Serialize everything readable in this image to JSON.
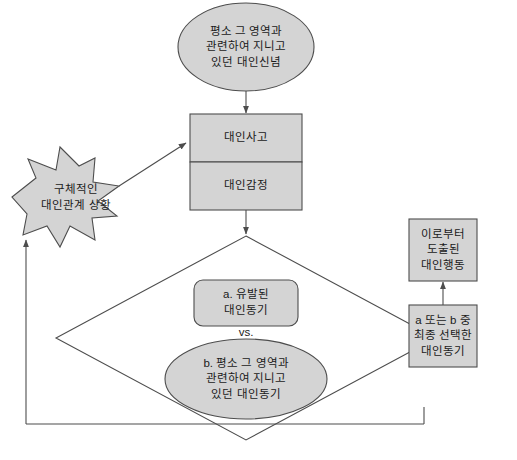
{
  "diagram": {
    "colors": {
      "fill": "#d4d4d4",
      "stroke": "#4d4d4d",
      "text": "#1a1a1a",
      "background": "#ffffff"
    },
    "nodes": [
      {
        "id": "prior-belief",
        "shape": "ellipse",
        "lines": [
          "평소 그 영역과",
          "관련하여 지니고",
          "있던 대인신념"
        ]
      },
      {
        "id": "interpersonal-thought",
        "shape": "rect",
        "lines": [
          "대인사고"
        ]
      },
      {
        "id": "interpersonal-emotion",
        "shape": "rect",
        "lines": [
          "대인감정"
        ]
      },
      {
        "id": "concrete-situation",
        "shape": "starburst",
        "lines": [
          "구체적인",
          "대인관계 상황"
        ]
      },
      {
        "id": "motive-a",
        "shape": "rounded-rect",
        "lines": [
          "a. 유발된",
          "대인동기"
        ]
      },
      {
        "id": "versus",
        "shape": "text",
        "lines": [
          "vs."
        ]
      },
      {
        "id": "motive-b",
        "shape": "ellipse",
        "lines": [
          "b. 평소 그 영역과",
          "관련하여 지니고",
          "있던 대인동기"
        ]
      },
      {
        "id": "final-motive",
        "shape": "rect",
        "lines": [
          "a 또는 b 중",
          "최종 선택한",
          "대인동기"
        ]
      },
      {
        "id": "resulting-behavior",
        "shape": "rect",
        "lines": [
          "이로부터",
          "도출된",
          "대인행동"
        ]
      }
    ],
    "edges": [
      {
        "id": "edge-belief-to-thought",
        "from": "prior-belief",
        "to": "interpersonal-thought"
      },
      {
        "id": "edge-situation-to-thought",
        "from": "concrete-situation",
        "to": "interpersonal-thought"
      },
      {
        "id": "edge-emotion-to-diamond",
        "from": "interpersonal-emotion",
        "to": "decision-diamond"
      },
      {
        "id": "edge-diamond-to-final",
        "from": "decision-diamond",
        "to": "final-motive"
      },
      {
        "id": "edge-final-to-behavior",
        "from": "final-motive",
        "to": "resulting-behavior"
      },
      {
        "id": "edge-feedback-loop",
        "from": "final-motive",
        "to": "concrete-situation"
      }
    ]
  }
}
